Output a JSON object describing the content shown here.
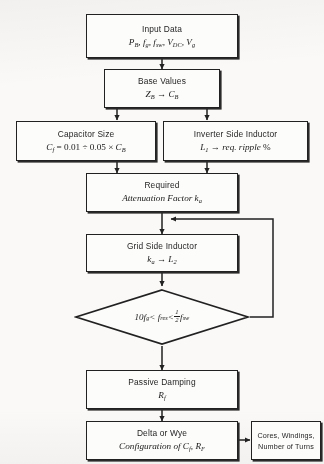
{
  "diagram": {
    "type": "flowchart",
    "line_color": "#1e1e1e",
    "background_color": "#fbfaf8"
  },
  "nodes": {
    "input_data": {
      "shape": "rectangle",
      "line1": "Input Data",
      "line2_html": "P<sub>B</sub>, f<sub>g</sub>, f<sub>sw</sub>, V<sub>DC</sub>, V<sub>g</sub>"
    },
    "base_values": {
      "shape": "rectangle",
      "line1": "Base Values",
      "line2_html": "Z<sub>B</sub> → C<sub>B</sub>"
    },
    "capacitor_size": {
      "shape": "rectangle",
      "line1": "Capacitor Size",
      "line2_html": "C<sub>f</sub> <span class=\"up\">= 0.01 ÷ 0.05 ×</span> C<sub>B</sub>"
    },
    "inverter_side_inductor": {
      "shape": "rectangle",
      "line1": "Inverter Side Inductor",
      "line2_html": "L<sub>1</sub> → req. ripple <span class=\"up\">%</span>"
    },
    "required_attenuation": {
      "shape": "rectangle",
      "line1": "Required",
      "line2_html": "Attenuation Factor k<sub>a</sub>",
      "line1_is_plain": true
    },
    "grid_side_inductor": {
      "shape": "rectangle",
      "line1": "Grid Side Inductor",
      "line2_html": "k<sub>a</sub> → L<sub>2</sub>"
    },
    "resonance_check": {
      "shape": "diamond",
      "condition_html": "10f<sub>g</sub> &lt; f<sub>res</sub> &lt; <span class=\"frac\"><span class=\"num\">1</span><span class=\"den\">2</span></span> f<sub>sw</sub>"
    },
    "passive_damping": {
      "shape": "rectangle",
      "line1": "Passive Damping",
      "line2_html": "R<sub>f</sub>"
    },
    "delta_or_wye": {
      "shape": "rectangle",
      "line1": "Delta or Wye",
      "line2_html": "Configuration of C<sub>f</sub>, R<sub>F</sub>"
    },
    "cores_windings": {
      "shape": "rectangle",
      "line1": "Cores, Windings,",
      "line2": "Number of Turns"
    }
  },
  "edges": [
    {
      "from": "input_data",
      "to": "base_values",
      "style": "arrow-down"
    },
    {
      "from": "base_values",
      "to": "capacitor_size",
      "style": "arrow-down"
    },
    {
      "from": "base_values",
      "to": "inverter_side_inductor",
      "style": "arrow-down"
    },
    {
      "from": "capacitor_size",
      "to": "required_attenuation",
      "style": "arrow-down"
    },
    {
      "from": "inverter_side_inductor",
      "to": "required_attenuation",
      "style": "arrow-down"
    },
    {
      "from": "required_attenuation",
      "to": "grid_side_inductor",
      "style": "arrow-down"
    },
    {
      "from": "grid_side_inductor",
      "to": "resonance_check",
      "style": "arrow-down"
    },
    {
      "from": "resonance_check",
      "to": "required_attenuation",
      "style": "feedback-loop-right"
    },
    {
      "from": "resonance_check",
      "to": "passive_damping",
      "style": "arrow-down"
    },
    {
      "from": "passive_damping",
      "to": "delta_or_wye",
      "style": "arrow-down"
    },
    {
      "from": "delta_or_wye",
      "to": "cores_windings",
      "style": "arrow-right"
    }
  ]
}
